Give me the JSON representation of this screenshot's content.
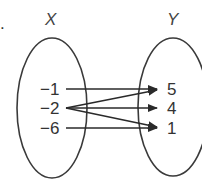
{
  "diagram": {
    "type": "mapping-diagram",
    "domain_set": {
      "label": "X",
      "elements": [
        "−1",
        "−2",
        "−6"
      ]
    },
    "range_set": {
      "label": "Y",
      "elements": [
        "5",
        "4",
        "1"
      ]
    },
    "mappings": [
      {
        "from": "−1",
        "to": "5"
      },
      {
        "from": "−2",
        "to": "5"
      },
      {
        "from": "−2",
        "to": "4"
      },
      {
        "from": "−2",
        "to": "1"
      },
      {
        "from": "−6",
        "to": "1"
      }
    ],
    "marker": "."
  },
  "colors": {
    "stroke": "#3a3a3a",
    "text": "#333333",
    "background": "#ffffff"
  }
}
